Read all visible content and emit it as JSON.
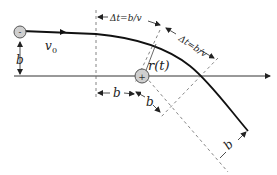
{
  "diagram": {
    "type": "physics-scattering-geometry",
    "colors": {
      "trajectory": "#111111",
      "axis": "#333333",
      "dashed": "#666666",
      "charge_fill": "#cfcfcf",
      "charge_stroke": "#555555",
      "text": "#222222"
    },
    "charges": [
      {
        "id": "moving",
        "sign": "-"
      },
      {
        "id": "fixed",
        "sign": "+"
      }
    ],
    "labels": {
      "velocity": "v",
      "velocity_sub": "0",
      "impact_left": "b",
      "position": "r(t)",
      "delta_t_top": "Δt=b/v",
      "delta_t_diag": "Δt=b/v",
      "b_horizontal": "b",
      "b_diagonal_mid": "b",
      "b_diagonal_end": "b"
    }
  }
}
